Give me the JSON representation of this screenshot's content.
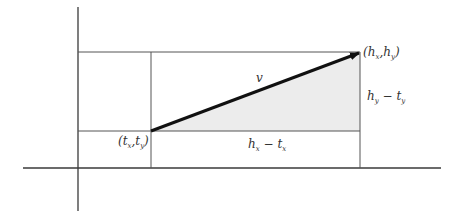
{
  "diagram": {
    "labels": {
      "vector": "v",
      "head_point": {
        "open": "(",
        "h1": "h",
        "s1": "x",
        "comma": ",",
        "h2": "h",
        "s2": "y",
        "close": ")"
      },
      "tail_point": {
        "open": "(",
        "t1": "t",
        "s1": "x",
        "comma": ",",
        "t2": "t",
        "s2": "y",
        "close": ")"
      },
      "dx": {
        "a": "h",
        "as": "x",
        "minus": " − ",
        "b": "t",
        "bs": "x"
      },
      "dy": {
        "a": "h",
        "as": "y",
        "minus": " − ",
        "b": "t",
        "bs": "y"
      }
    },
    "colors": {
      "line": "#3a3a3a",
      "arrow": "#111111",
      "shade": "#ececec",
      "background": "#ffffff"
    }
  }
}
